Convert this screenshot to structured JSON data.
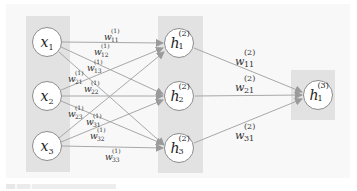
{
  "diagram": {
    "type": "feedforward-neural-network",
    "colors": {
      "background": "#f8f8f8",
      "layer_panel": "#e2e2e2",
      "node_fill": "#ffffff",
      "node_border": "#8c8c8c",
      "edge": "#a0a0a0"
    },
    "layers": [
      {
        "name": "input",
        "nodes": [
          {
            "id": "x1",
            "base": "x",
            "sub": "1",
            "sup": ""
          },
          {
            "id": "x2",
            "base": "x",
            "sub": "2",
            "sup": ""
          },
          {
            "id": "x3",
            "base": "x",
            "sub": "3",
            "sup": ""
          }
        ]
      },
      {
        "name": "hidden",
        "nodes": [
          {
            "id": "h1_2",
            "base": "h",
            "sub": "1",
            "sup": "(2)"
          },
          {
            "id": "h2_2",
            "base": "h",
            "sub": "2",
            "sup": "(2)"
          },
          {
            "id": "h3_2",
            "base": "h",
            "sub": "3",
            "sup": "(2)"
          }
        ]
      },
      {
        "name": "output",
        "nodes": [
          {
            "id": "h1_3",
            "base": "h",
            "sub": "1",
            "sup": "(3)"
          }
        ]
      }
    ],
    "edges_layer1": [
      {
        "from": "x1",
        "to": "h1_2",
        "base": "w",
        "sub": "11",
        "sup": "(1)"
      },
      {
        "from": "x1",
        "to": "h2_2",
        "base": "w",
        "sub": "12",
        "sup": "(1)"
      },
      {
        "from": "x1",
        "to": "h3_2",
        "base": "w",
        "sub": "13",
        "sup": "(1)"
      },
      {
        "from": "x2",
        "to": "h1_2",
        "base": "w",
        "sub": "21",
        "sup": "(1)"
      },
      {
        "from": "x2",
        "to": "h2_2",
        "base": "w",
        "sub": "22",
        "sup": "(1)"
      },
      {
        "from": "x2",
        "to": "h3_2",
        "base": "w",
        "sub": "23",
        "sup": "(1)"
      },
      {
        "from": "x3",
        "to": "h1_2",
        "base": "w",
        "sub": "31",
        "sup": "(1)"
      },
      {
        "from": "x3",
        "to": "h2_2",
        "base": "w",
        "sub": "32",
        "sup": "(1)"
      },
      {
        "from": "x3",
        "to": "h3_2",
        "base": "w",
        "sub": "33",
        "sup": "(1)"
      }
    ],
    "edges_layer2": [
      {
        "from": "h1_2",
        "to": "h1_3",
        "base": "w",
        "sub": "11",
        "sup": "(2)"
      },
      {
        "from": "h2_2",
        "to": "h1_3",
        "base": "w",
        "sub": "21",
        "sup": "(2)"
      },
      {
        "from": "h3_2",
        "to": "h1_3",
        "base": "w",
        "sub": "31",
        "sup": "(2)"
      }
    ]
  }
}
